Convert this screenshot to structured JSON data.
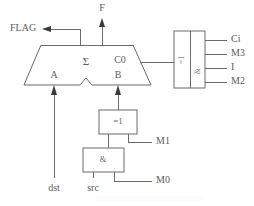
{
  "diagram": {
    "colors": {
      "line": "#6b6b6b",
      "text": "#5c5c5c",
      "arrow": "#3a3a3a",
      "background": "#ffffff"
    },
    "alu": {
      "name": "arithmetic-logic-unit",
      "center_label": "Σ",
      "input_a_label": "A",
      "input_b_label": "B",
      "carry_out_label": "C0"
    },
    "outputs": {
      "flag_label": "FLAG",
      "result_label": "F"
    },
    "control_box": {
      "name": "control-decoder",
      "left_cell_label": "=1",
      "right_cell_label": "&",
      "pins": [
        {
          "label": "Ci"
        },
        {
          "label": "M3"
        },
        {
          "label": "I"
        },
        {
          "label": "M2"
        }
      ]
    },
    "xor_gate": {
      "label": "=1",
      "control_input_label": "M1"
    },
    "and_gate": {
      "label": "&",
      "control_input_label": "M0"
    },
    "bus_inputs": {
      "dst_label": "dst",
      "src_label": "src"
    }
  }
}
